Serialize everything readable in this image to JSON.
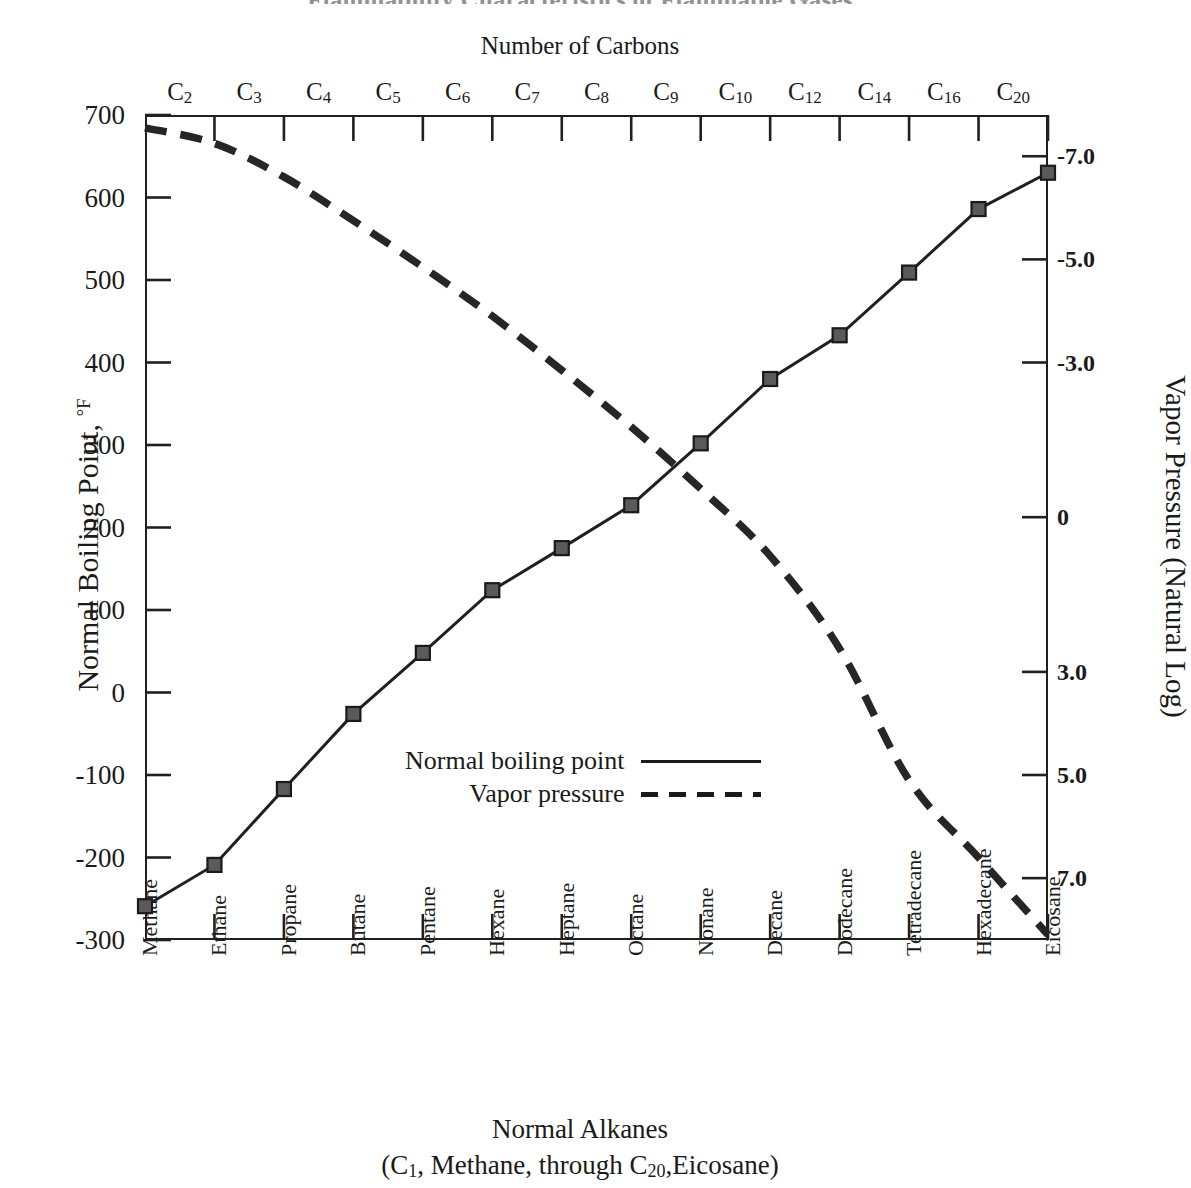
{
  "figure": {
    "clipped_header": "Flammability Characteristics of Flammable Gases",
    "top_axis_title": "Number of Carbons",
    "left_axis_title_main": "Normal Boiling Point, ",
    "left_axis_title_unit": "°F",
    "right_axis_title": "Vapor Pressure  (Natural Log)",
    "bottom_title_line1": "Normal Alkanes",
    "bottom_title_line2_pre": "(C",
    "bottom_title_line2_sub1": "1",
    "bottom_title_line2_mid": ", Methane, through C",
    "bottom_title_line2_sub2": "20",
    "bottom_title_line2_post": ",Eicosane)"
  },
  "legend": {
    "items": [
      {
        "label": "Normal boiling point",
        "style": "solid"
      },
      {
        "label": "Vapor pressure",
        "style": "dashed"
      }
    ]
  },
  "chart_data": {
    "type": "line",
    "title": "Flammability Characteristics of Flammable Gases",
    "xlabel": "Normal Alkanes (C1, Methane, through C20, Eicosane)",
    "xlabel_top": "Number of Carbons",
    "ylabel": "Normal Boiling Point, °F",
    "ylabel_right": "Vapor Pressure (Natural Log)",
    "ylim": [
      -300,
      700
    ],
    "ylim_right": [
      8.2,
      -7.8
    ],
    "yticks": [
      700,
      600,
      500,
      400,
      300,
      200,
      100,
      0,
      -100,
      -200,
      -300
    ],
    "ytick_labels": [
      "700",
      "600",
      "500",
      "400",
      "300",
      "200",
      "100",
      "0",
      "-100",
      "-200",
      "-300"
    ],
    "yticks_right": [
      -7.0,
      -5.0,
      -3.0,
      0,
      3.0,
      5.0,
      7.0
    ],
    "ytick_labels_right": [
      "-7.0",
      "-5.0",
      "-3.0",
      "0",
      "3.0",
      "5.0",
      "7.0"
    ],
    "grid": false,
    "legend_position": "center",
    "categories": [
      "Methane",
      "Ethane",
      "Propane",
      "Butane",
      "Pentane",
      "Hexane",
      "Heptane",
      "Octane",
      "Nonane",
      "Decane",
      "Dodecane",
      "Tetradecane",
      "Hexadecane",
      "Eicosane"
    ],
    "carbon_labels": [
      "C2",
      "C3",
      "C4",
      "C5",
      "C6",
      "C7",
      "C8",
      "C9",
      "C10",
      "C12",
      "C14",
      "C16",
      "C20"
    ],
    "carbon_numbers": [
      1,
      2,
      3,
      4,
      5,
      6,
      7,
      8,
      9,
      10,
      12,
      14,
      16,
      20
    ],
    "series": [
      {
        "name": "Normal boiling point",
        "units": "°F",
        "axis": "left",
        "style": "solid",
        "marker": "square",
        "values": [
          -259,
          -209,
          -117,
          -26,
          48,
          124,
          175,
          227,
          302,
          380,
          433,
          509,
          586,
          630
        ]
      },
      {
        "name": "Vapor pressure",
        "units": "natural log",
        "axis": "right",
        "style": "dashed",
        "marker": "none",
        "values": [
          -7.55,
          -7.25,
          -6.6,
          -5.75,
          -4.85,
          -3.9,
          -2.85,
          -1.75,
          -0.55,
          0.75,
          2.55,
          5.1,
          6.6,
          8.1
        ]
      }
    ]
  }
}
